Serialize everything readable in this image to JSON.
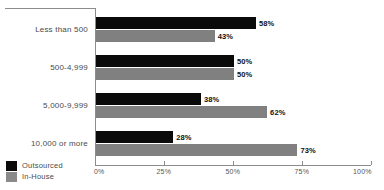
{
  "chart_data": {
    "type": "bar",
    "orientation": "horizontal",
    "title": "",
    "xlabel": "",
    "ylabel": "",
    "categories": [
      "Less than 500",
      "500-4,999",
      "5,000-9,999",
      "10,000 or more"
    ],
    "series": [
      {
        "name": "Outsourced",
        "color": "#0a0a0a",
        "values": [
          58,
          50,
          38,
          28
        ],
        "labels": [
          "58%",
          "50%",
          "38%",
          "28%"
        ]
      },
      {
        "name": "In-House",
        "color": "#808080",
        "values": [
          43,
          50,
          62,
          73
        ],
        "labels": [
          "43%",
          "50%",
          "62%",
          "73%"
        ]
      }
    ],
    "xlim": [
      0,
      100
    ],
    "xticks": [
      0,
      25,
      50,
      75,
      100
    ],
    "xtick_labels": [
      "0%",
      "25%",
      "50%",
      "75%",
      "100%"
    ],
    "grid": false,
    "legend_position": "bottom-left"
  }
}
